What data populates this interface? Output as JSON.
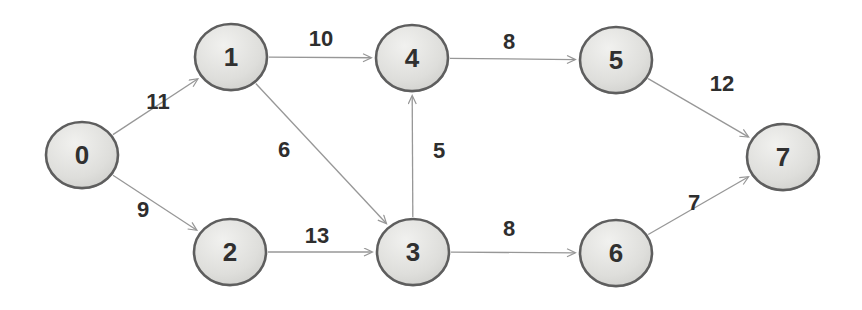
{
  "diagram": {
    "name": "directed-weighted-graph",
    "background": "#ffffff",
    "node_style": {
      "fill_center": "#f1f1ef",
      "fill_mid": "#dededb",
      "fill_edge": "#c4c4c1",
      "border_color": "#5e5e5e",
      "text_color": "#303030",
      "rx": 36,
      "ry": 33
    },
    "edge_style": {
      "stroke_color": "#979797",
      "label_color": "#2e2e2e"
    },
    "nodes": [
      {
        "id": "0",
        "label": "0",
        "x": 82,
        "y": 155
      },
      {
        "id": "1",
        "label": "1",
        "x": 231,
        "y": 57
      },
      {
        "id": "2",
        "label": "2",
        "x": 230,
        "y": 252
      },
      {
        "id": "3",
        "label": "3",
        "x": 413,
        "y": 252
      },
      {
        "id": "4",
        "label": "4",
        "x": 412,
        "y": 58
      },
      {
        "id": "5",
        "label": "5",
        "x": 616,
        "y": 60
      },
      {
        "id": "6",
        "label": "6",
        "x": 616,
        "y": 253
      },
      {
        "id": "7",
        "label": "7",
        "x": 783,
        "y": 157
      }
    ],
    "edges": [
      {
        "from": "0",
        "to": "1",
        "weight": "11",
        "label_x": 158,
        "label_y": 101
      },
      {
        "from": "0",
        "to": "2",
        "weight": "9",
        "label_x": 143,
        "label_y": 209
      },
      {
        "from": "1",
        "to": "4",
        "weight": "10",
        "label_x": 321,
        "label_y": 38
      },
      {
        "from": "1",
        "to": "3",
        "weight": "6",
        "label_x": 284,
        "label_y": 149
      },
      {
        "from": "2",
        "to": "3",
        "weight": "13",
        "label_x": 317,
        "label_y": 235
      },
      {
        "from": "3",
        "to": "4",
        "weight": "5",
        "label_x": 439,
        "label_y": 150
      },
      {
        "from": "3",
        "to": "6",
        "weight": "8",
        "label_x": 509,
        "label_y": 228
      },
      {
        "from": "4",
        "to": "5",
        "weight": "8",
        "label_x": 509,
        "label_y": 41
      },
      {
        "from": "5",
        "to": "7",
        "weight": "12",
        "label_x": 722,
        "label_y": 83
      },
      {
        "from": "6",
        "to": "7",
        "weight": "7",
        "label_x": 694,
        "label_y": 202
      }
    ]
  }
}
